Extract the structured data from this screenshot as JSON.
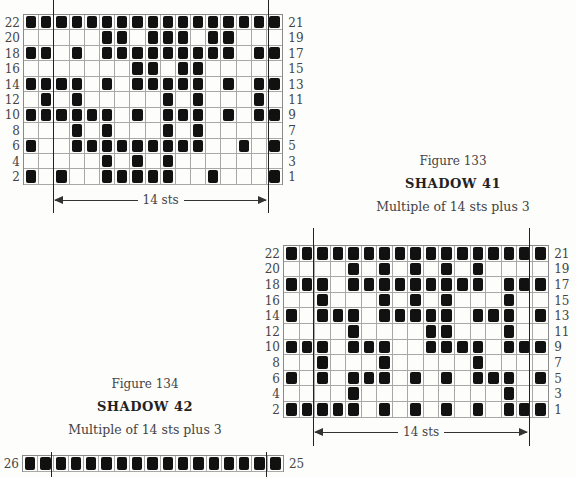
{
  "chart_data": [
    {
      "type": "table",
      "title": "SHADOW 41",
      "figure": "Figure 133",
      "subtitle": "Multiple of 14 sts plus 3",
      "columns": 17,
      "repeat_label": "14 sts",
      "left_labels": [
        "22",
        "20",
        "18",
        "16",
        "14",
        "12",
        "10",
        "8",
        "6",
        "4",
        "2"
      ],
      "right_labels": [
        "21",
        "19",
        "17",
        "15",
        "13",
        "11",
        "9",
        "7",
        "5",
        "3",
        "1"
      ],
      "rows": [
        {
          "row": 22,
          "filled": [
            0,
            1,
            2,
            3,
            4,
            5,
            6,
            7,
            8,
            9,
            10,
            11,
            12,
            13,
            14,
            15,
            16
          ]
        },
        {
          "row": 20,
          "filled": [
            5,
            6,
            8,
            9,
            10,
            12,
            13
          ]
        },
        {
          "row": 18,
          "filled": [
            0,
            1,
            3,
            5,
            6,
            7,
            8,
            9,
            10,
            11,
            12,
            13,
            15,
            16
          ]
        },
        {
          "row": 16,
          "filled": [
            7,
            8,
            10,
            11
          ]
        },
        {
          "row": 14,
          "filled": [
            0,
            1,
            2,
            3,
            5,
            7,
            8,
            9,
            10,
            11,
            13,
            15,
            16
          ]
        },
        {
          "row": 12,
          "filled": [
            1,
            3,
            9,
            11,
            15
          ]
        },
        {
          "row": 10,
          "filled": [
            0,
            1,
            2,
            3,
            4,
            5,
            7,
            9,
            10,
            11,
            13,
            15,
            16
          ]
        },
        {
          "row": 8,
          "filled": [
            3,
            5,
            9,
            11
          ]
        },
        {
          "row": 6,
          "filled": [
            0,
            3,
            4,
            5,
            6,
            7,
            8,
            9,
            10,
            11,
            14,
            16
          ]
        },
        {
          "row": 4,
          "filled": [
            5,
            7,
            9
          ]
        },
        {
          "row": 2,
          "filled": [
            0,
            2,
            5,
            6,
            7,
            8,
            9,
            12,
            16
          ]
        }
      ]
    },
    {
      "type": "table",
      "title": "SHADOW 42",
      "figure": "Figure 134",
      "subtitle": "Multiple of 14 sts plus 3",
      "columns": 17,
      "repeat_label": "14 sts",
      "left_labels": [
        "22",
        "20",
        "18",
        "16",
        "14",
        "12",
        "10",
        "8",
        "6",
        "4",
        "2"
      ],
      "right_labels": [
        "21",
        "19",
        "17",
        "15",
        "13",
        "11",
        "9",
        "7",
        "5",
        "3",
        "1"
      ],
      "rows": [
        {
          "row": 22,
          "filled": [
            0,
            1,
            2,
            3,
            4,
            5,
            6,
            7,
            8,
            9,
            10,
            11,
            12,
            13,
            14,
            15,
            16
          ]
        },
        {
          "row": 20,
          "filled": [
            4,
            6,
            8,
            10,
            12
          ]
        },
        {
          "row": 18,
          "filled": [
            0,
            1,
            2,
            4,
            5,
            6,
            7,
            8,
            9,
            10,
            11,
            12,
            14,
            15,
            16
          ]
        },
        {
          "row": 16,
          "filled": [
            2,
            6,
            8,
            10,
            14
          ]
        },
        {
          "row": 14,
          "filled": [
            0,
            2,
            3,
            4,
            6,
            7,
            8,
            9,
            10,
            12,
            13,
            14,
            16
          ]
        },
        {
          "row": 12,
          "filled": [
            4,
            9,
            10,
            14
          ]
        },
        {
          "row": 10,
          "filled": [
            0,
            1,
            2,
            4,
            5,
            6,
            9,
            10,
            11,
            12,
            14,
            15,
            16
          ]
        },
        {
          "row": 8,
          "filled": [
            2,
            6,
            12
          ]
        },
        {
          "row": 6,
          "filled": [
            0,
            2,
            4,
            5,
            6,
            8,
            10,
            12,
            13,
            14,
            16
          ]
        },
        {
          "row": 4,
          "filled": [
            4,
            14
          ]
        },
        {
          "row": 2,
          "filled": [
            0,
            1,
            2,
            3,
            4,
            6,
            8,
            10,
            12,
            14,
            15,
            16
          ]
        }
      ]
    },
    {
      "type": "table",
      "partial": true,
      "columns": 17,
      "left_labels": [
        "26"
      ],
      "right_labels": [
        "25"
      ],
      "rows": [
        {
          "row": 26,
          "filled": [
            0,
            1,
            2,
            3,
            4,
            5,
            6,
            7,
            8,
            9,
            10,
            11,
            12,
            13,
            14,
            15,
            16
          ]
        }
      ]
    }
  ],
  "captions": {
    "fig133": {
      "figure": "Figure 133",
      "title": "SHADOW 41",
      "subtitle": "Multiple of 14 sts plus 3"
    },
    "fig134": {
      "figure": "Figure 134",
      "title": "SHADOW 42",
      "subtitle": "Multiple of 14 sts plus 3"
    }
  },
  "repeat": {
    "label": "14 sts"
  },
  "partial_chart": {
    "left_label": "26",
    "right_label": "25"
  }
}
